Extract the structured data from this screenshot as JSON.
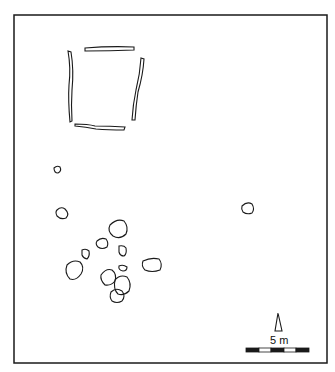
{
  "figure": {
    "type": "archaeological-site-plan",
    "background_color": "#ffffff",
    "line_color": "#1a1a1a"
  },
  "features": {
    "enclosure_ditches": {
      "description": "rectangular enclosure formed by four linear trenches",
      "count": 4,
      "segments": [
        "north",
        "east",
        "south",
        "west"
      ]
    },
    "pits": {
      "description": "scattered oval/polygonal pits",
      "count": 16
    }
  },
  "north_arrow": {
    "icon": "north-arrow-icon"
  },
  "scale_bar": {
    "label": "5 m",
    "segments": 5,
    "pattern": [
      "black",
      "white",
      "black",
      "white",
      "black"
    ]
  }
}
